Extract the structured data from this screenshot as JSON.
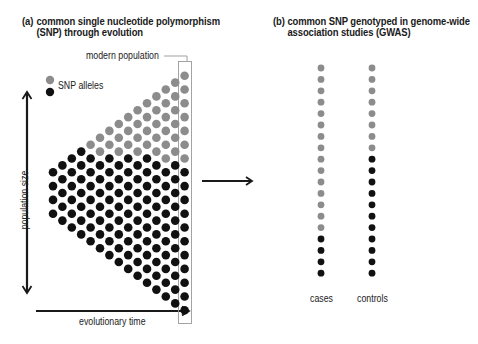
{
  "panel_a": {
    "label": "(a)",
    "title_line1": "common single nucleotide polymorphism",
    "title_line2": "(SNP) through evolution",
    "modern_population_label": "modern population",
    "legend_label": "SNP alleles",
    "y_axis_label": "population size",
    "x_axis_label": "evolutionary time",
    "triangle": {
      "columns": 15,
      "first_column_dots": 4,
      "last_column_dots": 18,
      "tip_x": 53,
      "center_y": 193,
      "dx": 9.4,
      "dy": 13.8,
      "radius": 4.3
    }
  },
  "panel_b": {
    "label": "(b)",
    "title_line1": "common SNP genotyped in genome-wide",
    "title_line2": "association studies (GWAS)",
    "groups": [
      {
        "name": "cases",
        "gray": 15,
        "black": 4
      },
      {
        "name": "controls",
        "gray": 8,
        "black": 11
      }
    ]
  },
  "colors": {
    "gray_allele": "#8c8c8c",
    "black_allele": "#111111",
    "arrow": "#1a1a1a",
    "box": "#9a9a9a"
  }
}
